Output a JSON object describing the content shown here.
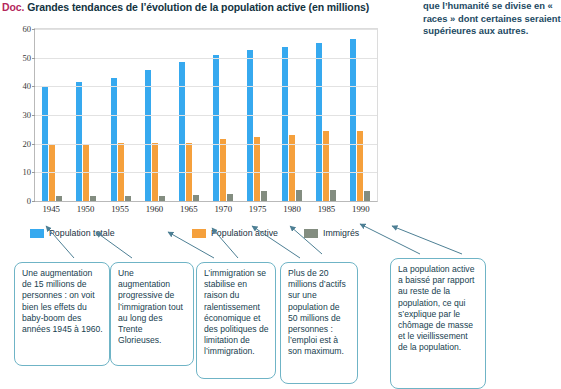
{
  "document": {
    "tag": "Doc.",
    "title": "Grandes tendances de l’évolution de la population active (en millions)",
    "side_note": "que l’humanité se divise en « races » dont certaines seraient supérieures aux autres."
  },
  "colors": {
    "tag": "#b5275c",
    "total": "#36a9ef",
    "active": "#f5a03c",
    "immigres": "#838d80",
    "callout_border": "#6fb4c6",
    "text": "#17414f"
  },
  "legend": {
    "items": [
      {
        "label": "Population totale",
        "color": "#36a9ef"
      },
      {
        "label": "Population active",
        "color": "#f5a03c"
      },
      {
        "label": "Immigrés",
        "color": "#838d80"
      }
    ]
  },
  "chart_data": {
    "type": "bar",
    "title": "Grandes tendances de l’évolution de la population active (en millions)",
    "xlabel": "",
    "ylabel": "",
    "ylim": [
      0,
      60
    ],
    "yticks": [
      0,
      10,
      20,
      30,
      40,
      50,
      60
    ],
    "grid": true,
    "legend_position": "bottom",
    "categories": [
      "1945",
      "1950",
      "1955",
      "1960",
      "1965",
      "1970",
      "1975",
      "1980",
      "1985",
      "1990"
    ],
    "series": [
      {
        "name": "Population totale",
        "color": "#36a9ef",
        "values": [
          39.7,
          41.6,
          43.0,
          45.6,
          48.5,
          50.8,
          52.7,
          53.9,
          55.2,
          56.6
        ]
      },
      {
        "name": "Population active",
        "color": "#f5a03c",
        "values": [
          19.9,
          19.9,
          20.2,
          20.2,
          20.4,
          21.8,
          22.2,
          23.0,
          24.5,
          24.5
        ]
      },
      {
        "name": "Immigrés",
        "color": "#838d80",
        "values": [
          1.7,
          1.7,
          1.8,
          1.8,
          2.1,
          2.6,
          3.4,
          3.7,
          3.7,
          3.6
        ]
      }
    ]
  },
  "callouts": [
    {
      "id": "callout-1945-1960-baby-boom",
      "text": "Une augmentation de 15 millions de personnes : on voit bien les effets du baby-boom des années 1945 à 1960."
    },
    {
      "id": "callout-immigration-trente-glorieuses",
      "text": "Une augmentation progressive de l’immigration tout au long des Trente Glorieuses."
    },
    {
      "id": "callout-immigration-stabilisation",
      "text": "L’immigration se stabilise en raison du ralentissement économique et des politiques de limitation de l’immigration."
    },
    {
      "id": "callout-emploi-maximum",
      "text": "Plus de 20 millions d’actifs sur une population de 50 millions de personnes : l’emploi est à son maximum."
    },
    {
      "id": "callout-population-active-baisse",
      "text": "La population active a baissé par rapport au reste de la population, ce qui s’explique par le chômage de masse et le vieillissement de la population."
    }
  ]
}
